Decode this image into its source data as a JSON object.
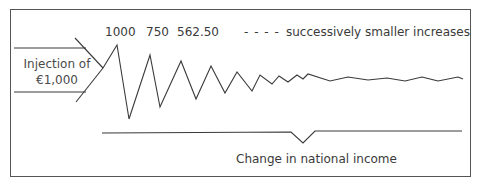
{
  "diagram": {
    "injection": {
      "line1": "Injection of",
      "line2": "€1,000"
    },
    "round_labels": [
      "1000",
      "750",
      "562.50"
    ],
    "continuation_dashes": "- - - -",
    "continuation_label": "successively smaller increases",
    "brace_label": "Change in national income",
    "colors": {
      "stroke": "#3a3a3a",
      "frame": "#555555",
      "background": "#ffffff"
    },
    "zigzag_points": [
      [
        103,
        68
      ],
      [
        117,
        45
      ],
      [
        129,
        119
      ],
      [
        150,
        55
      ],
      [
        160,
        107
      ],
      [
        181,
        61
      ],
      [
        196,
        99
      ],
      [
        211,
        66
      ],
      [
        225,
        93
      ],
      [
        237,
        72
      ],
      [
        252,
        91
      ],
      [
        260,
        75
      ],
      [
        272,
        84
      ],
      [
        279,
        76
      ],
      [
        288,
        82
      ],
      [
        297,
        75
      ],
      [
        303,
        79
      ],
      [
        308,
        74
      ],
      [
        330,
        81
      ],
      [
        348,
        77
      ],
      [
        368,
        80
      ],
      [
        387,
        78
      ],
      [
        405,
        81
      ],
      [
        422,
        77
      ],
      [
        438,
        81
      ],
      [
        458,
        77
      ],
      [
        463,
        79
      ]
    ]
  }
}
